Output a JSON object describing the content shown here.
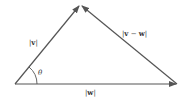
{
  "diagram": {
    "type": "vector-triangle",
    "stroke_color": "#555555",
    "vertices": {
      "origin": [
        15,
        84
      ],
      "tip_v": [
        80,
        5
      ],
      "tip_w": [
        177,
        84
      ]
    },
    "labels": {
      "v": {
        "bar_left": "|",
        "name": "v",
        "bar_right": "|"
      },
      "w": {
        "bar_left": "|",
        "name": "w",
        "bar_right": "|"
      },
      "v_minus_w": {
        "bar_left": "|",
        "name1": "v",
        "op": " − ",
        "name2": "w",
        "bar_right": "|"
      },
      "angle": "θ"
    }
  }
}
